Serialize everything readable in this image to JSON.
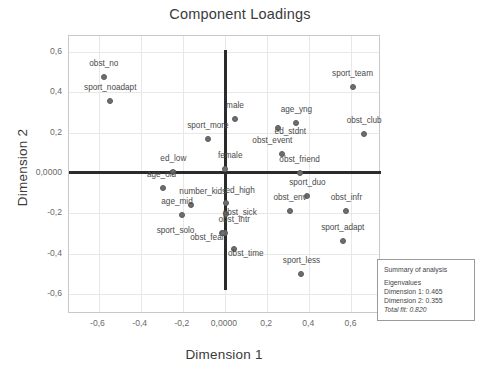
{
  "chart_data": {
    "type": "scatter",
    "title": "Component Loadings",
    "xlabel": "Dimension 1",
    "ylabel": "Dimension 2",
    "xlim": [
      -0.74,
      0.74
    ],
    "ylim": [
      -0.7,
      0.68
    ],
    "grid": true,
    "legend": null,
    "xticks": [
      "-0,6",
      "-0,4",
      "-0,2",
      "0,0000",
      "0,2",
      "0,4",
      "0,6"
    ],
    "xtick_values": [
      -0.6,
      -0.4,
      -0.2,
      0.0,
      0.2,
      0.4,
      0.6
    ],
    "yticks": [
      "0,6",
      "0,4",
      "0,2",
      "0,0000",
      "-0,2",
      "-0,4",
      "-0,6"
    ],
    "ytick_values": [
      0.6,
      0.4,
      0.2,
      0.0,
      -0.2,
      -0.4,
      -0.6
    ],
    "reference_lines": {
      "vertical_x": 0.0,
      "vertical_y_range": [
        -0.58,
        0.61
      ],
      "horizontal_y": 0.0,
      "horizontal_x_range": [
        -0.74,
        0.74
      ]
    },
    "marker_color": "#6e6e6e",
    "points": [
      {
        "label": "obst_no",
        "x": -0.575,
        "y": 0.478,
        "label_dx": 0,
        "label_dy": -9
      },
      {
        "label": "sport_noadapt",
        "x": -0.545,
        "y": 0.358,
        "label_dx": 0,
        "label_dy": -9
      },
      {
        "label": "sport_team",
        "x": 0.605,
        "y": 0.428,
        "label_dx": 0,
        "label_dy": -9
      },
      {
        "label": "age_yng",
        "x": 0.338,
        "y": 0.25,
        "label_dx": 0,
        "label_dy": -9
      },
      {
        "label": "obst_club",
        "x": 0.66,
        "y": 0.192,
        "label_dx": 0,
        "label_dy": -9
      },
      {
        "label": "male",
        "x": 0.048,
        "y": 0.268,
        "label_dx": 0,
        "label_dy": -9
      },
      {
        "label": "ed_stdnt",
        "x": 0.252,
        "y": 0.222,
        "label_dx": 12,
        "label_dy": 8
      },
      {
        "label": "sport_more",
        "x": -0.082,
        "y": 0.17,
        "label_dx": 0,
        "label_dy": -9
      },
      {
        "label": "obst_event",
        "x": 0.272,
        "y": 0.095,
        "label_dx": -10,
        "label_dy": -9
      },
      {
        "label": "female",
        "x": 0.002,
        "y": 0.022,
        "label_dx": 5,
        "label_dy": -9
      },
      {
        "label": "ed_low",
        "x": -0.245,
        "y": 0.006,
        "label_dx": 0,
        "label_dy": -9
      },
      {
        "label": "obst_friend",
        "x": 0.355,
        "y": 0.002,
        "label_dx": 0,
        "label_dy": -9
      },
      {
        "label": "age_old",
        "x": -0.292,
        "y": -0.075,
        "label_dx": -2,
        "label_dy": -9
      },
      {
        "label": "sport_duo",
        "x": 0.39,
        "y": -0.112,
        "label_dx": 0,
        "label_dy": -9
      },
      {
        "label": "ed_high",
        "x": 0.005,
        "y": -0.148,
        "label_dx": 14,
        "label_dy": -8
      },
      {
        "label": "number_kids",
        "x": -0.162,
        "y": -0.16,
        "label_dx": 12,
        "label_dy": -9
      },
      {
        "label": "obst_infr",
        "x": 0.575,
        "y": -0.19,
        "label_dx": 0,
        "label_dy": -9
      },
      {
        "label": "obst_env",
        "x": 0.308,
        "y": -0.19,
        "label_dx": 0,
        "label_dy": -9
      },
      {
        "label": "age_mid",
        "x": -0.205,
        "y": -0.21,
        "label_dx": -5,
        "label_dy": -9
      },
      {
        "label": "obst_sick",
        "x": 0.003,
        "y": -0.205,
        "label_dx": 14,
        "label_dy": 3
      },
      {
        "label": "obst_intr",
        "x": 0.0,
        "y": -0.298,
        "label_dx": 9,
        "label_dy": -9
      },
      {
        "label": "sport_solo",
        "x": -0.016,
        "y": -0.298,
        "label_dx": -46,
        "label_dy": 2
      },
      {
        "label": "obst_fear",
        "x": -0.008,
        "y": -0.3,
        "label_dx": -16,
        "label_dy": 9
      },
      {
        "label": "sport_adapt",
        "x": 0.558,
        "y": -0.338,
        "label_dx": 0,
        "label_dy": -9
      },
      {
        "label": "obst_time",
        "x": 0.043,
        "y": -0.378,
        "label_dx": 12,
        "label_dy": 9
      },
      {
        "label": "sport_less",
        "x": 0.362,
        "y": -0.502,
        "label_dx": 0,
        "label_dy": -9
      }
    ]
  },
  "summary": {
    "heading": "Summary of analysis",
    "eigen_heading": "Eigenvalues",
    "dim1": "Dimension 1: 0.465",
    "dim2": "Dimension 2: 0.355",
    "total_fit": "Total fit: 0.820"
  }
}
